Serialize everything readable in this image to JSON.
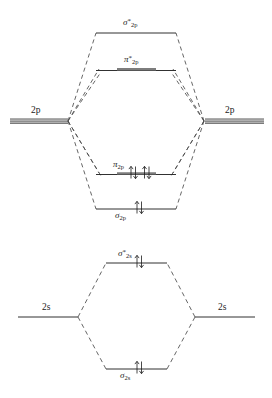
{
  "diagram": {
    "type": "mo-diagram",
    "panels": [
      {
        "id": "p-block",
        "atomic_label_left": "2p",
        "atomic_label_right": "2p",
        "levels": [
          {
            "name": "sigma-star-2p",
            "symbol": "σ",
            "star": "*",
            "subscript": "2p",
            "label_position": "above",
            "degenerate": false,
            "electrons": 0,
            "arrows": []
          },
          {
            "name": "pi-star-2p",
            "symbol": "π",
            "star": "*",
            "subscript": "2p",
            "label_position": "above",
            "degenerate": true,
            "electrons": 0,
            "arrows": []
          },
          {
            "name": "pi-2p",
            "symbol": "π",
            "star": "",
            "subscript": "2p",
            "label_position": "above",
            "degenerate": true,
            "electrons": 4,
            "arrows": [
              "up",
              "down",
              "up",
              "down"
            ]
          },
          {
            "name": "sigma-2p",
            "symbol": "σ",
            "star": "",
            "subscript": "2p",
            "label_position": "below",
            "degenerate": false,
            "electrons": 2,
            "arrows": [
              "up",
              "down"
            ]
          }
        ]
      },
      {
        "id": "s-block",
        "atomic_label_left": "2s",
        "atomic_label_right": "2s",
        "levels": [
          {
            "name": "sigma-star-2s",
            "symbol": "σ",
            "star": "*",
            "subscript": "2s",
            "label_position": "above",
            "degenerate": false,
            "electrons": 2,
            "arrows": [
              "up",
              "down"
            ]
          },
          {
            "name": "sigma-2s",
            "symbol": "σ",
            "star": "",
            "subscript": "2s",
            "label_position": "below",
            "degenerate": false,
            "electrons": 2,
            "arrows": [
              "up",
              "down"
            ]
          }
        ]
      }
    ],
    "colors": {
      "line": "#1a1a1a",
      "atomic_orbital_bar": "#7a7a7a",
      "degenerate_bar": "#8a8a8a",
      "background": "#ffffff"
    },
    "labels": {
      "sigma_star_2p": "σ*2p",
      "pi_star_2p": "π*2p",
      "pi_2p": "π2p",
      "sigma_2p": "σ2p",
      "sigma_star_2s": "σ*2s",
      "sigma_2s": "σ2s",
      "ao_2p_left": "2p",
      "ao_2p_right": "2p",
      "ao_2s_left": "2s",
      "ao_2s_right": "2s"
    }
  }
}
